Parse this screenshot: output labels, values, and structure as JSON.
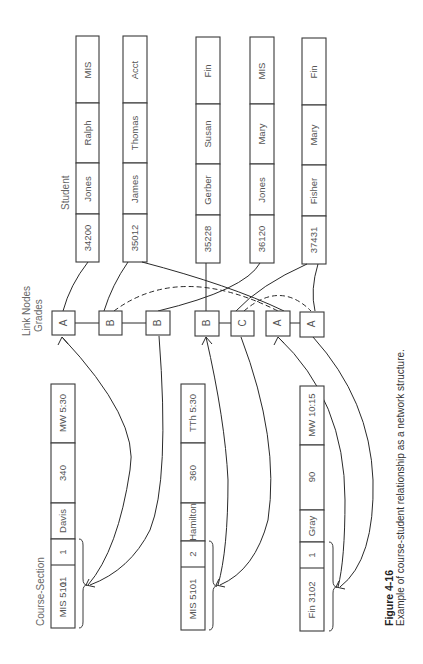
{
  "diagram": {
    "orientation": "rotated-90-ccw",
    "labels": {
      "student": "Student",
      "link_nodes": "Link Nodes",
      "grades": "Grades",
      "course_section": "Course-Section"
    },
    "students": [
      {
        "id": "34200",
        "last": "Jones",
        "first": "Ralph",
        "major": "MIS"
      },
      {
        "id": "35012",
        "last": "James",
        "first": "Thomas",
        "major": "Acct"
      },
      {
        "id": "35228",
        "last": "Gerber",
        "first": "Susan",
        "major": "Fin"
      },
      {
        "id": "36120",
        "last": "Jones",
        "first": "Mary",
        "major": "MIS"
      },
      {
        "id": "37431",
        "last": "Fisher",
        "first": "Mary",
        "major": "Fin"
      }
    ],
    "link_nodes": [
      {
        "grade": "A",
        "course_group": 0,
        "student": "34200"
      },
      {
        "grade": "B",
        "course_group": 0,
        "student": "35012"
      },
      {
        "grade": "B",
        "course_group": 0,
        "student": "36120"
      },
      {
        "grade": "B",
        "course_group": 1,
        "student": "35228"
      },
      {
        "grade": "C",
        "course_group": 1,
        "student": "37431"
      },
      {
        "grade": "A",
        "course_group": 2,
        "student": "35012"
      },
      {
        "grade": "A",
        "course_group": 2,
        "student": "37431"
      }
    ],
    "courses": [
      {
        "course": "MIS 5101",
        "section": "1",
        "instructor": "Davis",
        "room": "340",
        "time": "MW 5:30"
      },
      {
        "course": "MIS 5101",
        "section": "2",
        "instructor": "Hamilton",
        "room": "360",
        "time": "TTh 5:30"
      },
      {
        "course": "Fin 3102",
        "section": "1",
        "instructor": "Gray",
        "room": "90",
        "time": "MW 10:15"
      }
    ]
  },
  "caption": {
    "title": "Figure 4-16",
    "text": "Example of course-student relationship as a network structure."
  }
}
